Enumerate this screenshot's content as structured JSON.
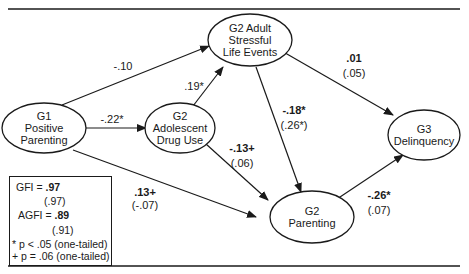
{
  "nodes": {
    "g1_parenting": {
      "label": [
        "G1",
        "Positive",
        "Parenting"
      ]
    },
    "g2_stress": {
      "label": [
        "G2 Adult",
        "Stressful",
        "Life Events"
      ]
    },
    "g2_drug": {
      "label": [
        "G2",
        "Adolescent",
        "Drug Use"
      ]
    },
    "g3_delinquency": {
      "label": [
        "G3",
        "Delinquency"
      ]
    },
    "g2_parenting": {
      "label": [
        "G2",
        "Parenting"
      ]
    }
  },
  "paths": [
    {
      "from": "G1 Positive Parenting",
      "to": "G2 Adult Stressful Life Events",
      "coef": "-.10",
      "alt": ""
    },
    {
      "from": "G1 Positive Parenting",
      "to": "G2 Adolescent Drug Use",
      "coef": "-.22*",
      "alt": ""
    },
    {
      "from": "G2 Adolescent Drug Use",
      "to": "G2 Adult Stressful Life Events",
      "coef": ".19*",
      "alt": ""
    },
    {
      "from": "G2 Adult Stressful Life Events",
      "to": "G3 Delinquency",
      "coef": ".01",
      "alt": "(.05)"
    },
    {
      "from": "G2 Adult Stressful Life Events",
      "to": "G2 Parenting",
      "coef": "-.18*",
      "alt": "(.26*)"
    },
    {
      "from": "G2 Adolescent Drug Use",
      "to": "G2 Parenting",
      "coef": "-.13+",
      "alt": "(.06)"
    },
    {
      "from": "G1 Positive Parenting",
      "to": "G2 Parenting",
      "coef": ".13+",
      "alt": "(-.07)"
    },
    {
      "from": "G2 Parenting",
      "to": "G3 Delinquency",
      "coef": "-.26*",
      "alt": "(.07)"
    }
  ],
  "legend": {
    "gfi_label": "GFI =",
    "gfi_value": ".97",
    "gfi_alt": "(.97)",
    "agfi_label": "AGFI =",
    "agfi_value": ".89",
    "agfi_alt": "(.91)",
    "note1": "* p < .05 (one-tailed)",
    "note2": "+ p = .06 (one-tailed)"
  }
}
